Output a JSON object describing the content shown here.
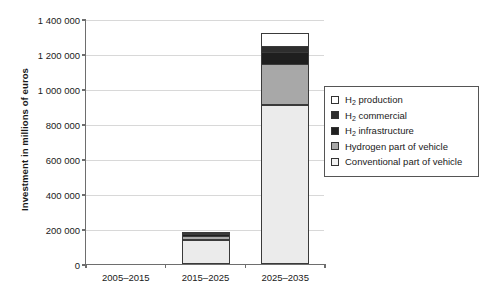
{
  "chart_data": {
    "type": "bar",
    "subtype": "stacked-bar",
    "title": "",
    "xlabel": "",
    "ylabel": "Investment in millions of euros",
    "categories": [
      "2005–2015",
      "2015–2025",
      "2025–2035"
    ],
    "ylim": [
      0,
      1400000
    ],
    "yticks": [
      0,
      200000,
      400000,
      600000,
      800000,
      1000000,
      1200000,
      1400000
    ],
    "ytick_labels": [
      "0",
      "200 000",
      "400 000",
      "600 000",
      "800 000",
      "1 000 000",
      "1 200 000",
      "1 400 000"
    ],
    "grid": true,
    "legend_position": "right",
    "series": [
      {
        "name": "Conventional part of vehicle",
        "color": "#ebebeb",
        "values": [
          0,
          135000,
          910000
        ]
      },
      {
        "name": "Hydrogen part of vehicle",
        "color": "#a8a8a8",
        "values": [
          0,
          25000,
          235000
        ]
      },
      {
        "name": "H2 infrastructure",
        "color": "#1f1f1f",
        "values": [
          0,
          18000,
          70000
        ]
      },
      {
        "name": "H2 commercial",
        "color": "#2e2e2e",
        "values": [
          0,
          12000,
          45000
        ]
      },
      {
        "name": "H2 production",
        "color": "#ffffff",
        "values": [
          0,
          5000,
          80000
        ]
      }
    ],
    "totals": [
      0,
      195000,
      1340000
    ]
  },
  "legend": {
    "entries": [
      {
        "label_html": "H2 production",
        "label_main": "H",
        "label_sub": "2",
        "label_rest": " production",
        "color": "#ffffff",
        "swatch_name": "legend-swatch-h2-production"
      },
      {
        "label_html": "H2 commercial",
        "label_main": "H",
        "label_sub": "2",
        "label_rest": " commercial",
        "color": "#2e2e2e",
        "swatch_name": "legend-swatch-h2-commercial"
      },
      {
        "label_html": "H2 infrastructure",
        "label_main": "H",
        "label_sub": "2",
        "label_rest": " infrastructure",
        "color": "#1f1f1f",
        "swatch_name": "legend-swatch-h2-infrastructure"
      },
      {
        "label_html": "Hydrogen part of vehicle",
        "label_main": "Hydrogen part of vehicle",
        "label_sub": "",
        "label_rest": "",
        "color": "#a8a8a8",
        "swatch_name": "legend-swatch-hydrogen-part"
      },
      {
        "label_html": "Conventional part of vehicle",
        "label_main": "Conventional part of vehicle",
        "label_sub": "",
        "label_rest": "",
        "color": "#f2f2f2",
        "swatch_name": "legend-swatch-conventional-part"
      }
    ]
  },
  "colors": {
    "axis": "#6e6e6e",
    "grid": "#d8d8d8",
    "text": "#1a1a1a",
    "bar_outline": "#3a3a3a",
    "background": "#ffffff"
  }
}
